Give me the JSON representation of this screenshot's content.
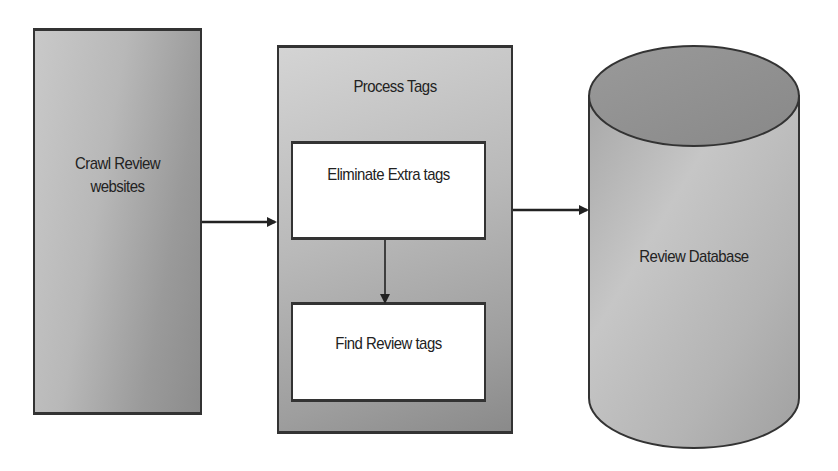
{
  "diagram": {
    "nodes": [
      {
        "id": "crawl",
        "label_line1": "Crawl Review",
        "label_line2": "websites",
        "shape": "rectangle"
      },
      {
        "id": "process",
        "label": "Process Tags",
        "shape": "rectangle-container",
        "children": [
          {
            "id": "eliminate",
            "label": "Eliminate Extra tags",
            "shape": "rectangle"
          },
          {
            "id": "find",
            "label": "Find Review tags",
            "shape": "rectangle"
          }
        ]
      },
      {
        "id": "database",
        "label": "Review Database",
        "shape": "cylinder"
      }
    ],
    "edges": [
      {
        "from": "crawl",
        "to": "process"
      },
      {
        "from": "eliminate",
        "to": "find"
      },
      {
        "from": "process",
        "to": "database"
      }
    ],
    "colors": {
      "stroke": "#333333",
      "fill_light": "#cccccc",
      "fill_dark": "#8c8c8c",
      "inner_fill": "#ffffff",
      "text": "#222222"
    }
  }
}
